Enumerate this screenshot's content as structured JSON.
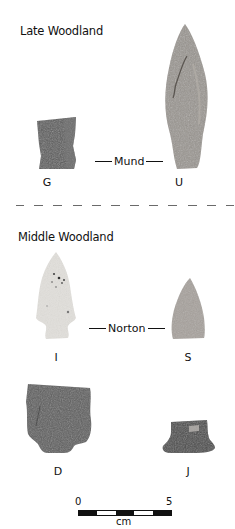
{
  "figure": {
    "top_caption_cropped": "",
    "sections": [
      {
        "title": "Late Woodland",
        "type_label": "Mund",
        "artifacts": [
          {
            "label": "G",
            "kind": "rectangular fragment",
            "tone": "#5b5b5b"
          },
          {
            "label": "U",
            "kind": "lanceolate point",
            "tone": "#9a9590"
          }
        ]
      },
      {
        "title": "Middle Woodland",
        "type_label": "Norton",
        "artifacts": [
          {
            "label": "I",
            "kind": "corner-notched point",
            "tone": "#e2e0dc"
          },
          {
            "label": "S",
            "kind": "triangular point fragment",
            "tone": "#a7a29d"
          },
          {
            "label": "D",
            "kind": "large base fragment",
            "tone": "#5e5e5e"
          },
          {
            "label": "J",
            "kind": "base fragment",
            "tone": "#4b4b4b"
          }
        ]
      }
    ],
    "scale": {
      "start_label": "0",
      "end_label": "5",
      "unit": "cm",
      "segments": [
        "dark",
        "light",
        "dark",
        "light",
        "dark"
      ]
    }
  }
}
